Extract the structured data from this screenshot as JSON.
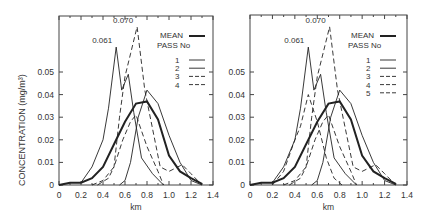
{
  "chart_data": [
    {
      "type": "line",
      "panel": "left",
      "title": "",
      "xlabel": "km",
      "ylabel": "CONCENTRATION (mg/m³)",
      "xlim": [
        0,
        1.4
      ],
      "ylim": [
        0,
        0.07
      ],
      "x_ticks": [
        "0",
        "0.2",
        "0.4",
        "0.6",
        "0.8",
        "1.0",
        "1.2",
        "1.4"
      ],
      "y_ticks": [
        "0",
        "0.01",
        "0.02",
        "0.03",
        "0.04",
        "0.05"
      ],
      "grid": false,
      "legend_position": "upper right",
      "legend_header": "PASS No",
      "annotations": [
        {
          "text": "0.061",
          "x": 0.52,
          "y": 0.061
        },
        {
          "text": "0.070",
          "x": 0.71,
          "y": 0.07
        }
      ],
      "series": [
        {
          "name": "MEAN",
          "style": "thick-solid",
          "x": [
            0,
            0.1,
            0.2,
            0.3,
            0.4,
            0.5,
            0.6,
            0.7,
            0.8,
            0.9,
            1.0,
            1.1,
            1.2,
            1.3
          ],
          "y": [
            0,
            0.001,
            0.001,
            0.003,
            0.008,
            0.018,
            0.028,
            0.036,
            0.037,
            0.029,
            0.013,
            0.006,
            0.003,
            0.0005
          ]
        },
        {
          "name": "1",
          "style": "solid",
          "x": [
            0.2,
            0.3,
            0.4,
            0.45,
            0.52,
            0.57,
            0.63,
            0.68,
            0.75,
            0.85,
            0.95
          ],
          "y": [
            0.001,
            0.008,
            0.02,
            0.034,
            0.061,
            0.042,
            0.049,
            0.032,
            0.012,
            0.005,
            0
          ],
          "peak_label": "0.061"
        },
        {
          "name": "2",
          "style": "solid",
          "x": [
            0.55,
            0.6,
            0.65,
            0.72,
            0.8,
            0.9,
            1.0,
            1.1,
            1.2,
            1.3
          ],
          "y": [
            0,
            0.002,
            0.01,
            0.03,
            0.042,
            0.036,
            0.022,
            0.01,
            0.002,
            0
          ]
        },
        {
          "name": "3",
          "style": "dashed",
          "x": [
            0.35,
            0.45,
            0.5,
            0.55,
            0.6,
            0.65,
            0.71,
            0.78,
            0.85,
            0.92,
            1.0,
            1.12,
            1.2,
            1.3
          ],
          "y": [
            0,
            0.003,
            0.008,
            0.03,
            0.048,
            0.058,
            0.07,
            0.042,
            0.025,
            0.008,
            0.006,
            0.009,
            0.005,
            0
          ]
        },
        {
          "name": "4",
          "style": "dashed",
          "x": [
            0.3,
            0.4,
            0.5,
            0.58,
            0.65,
            0.7,
            0.75,
            0.8,
            0.9,
            0.95
          ],
          "y": [
            0,
            0.002,
            0.008,
            0.02,
            0.028,
            0.031,
            0.024,
            0.017,
            0.006,
            0
          ]
        }
      ]
    },
    {
      "type": "line",
      "panel": "right",
      "title": "",
      "xlabel": "km",
      "ylabel": "",
      "xlim": [
        0,
        1.4
      ],
      "ylim": [
        0,
        0.07
      ],
      "x_ticks": [
        "0",
        "0.2",
        "0.4",
        "0.6",
        "0.8",
        "1.0",
        "1.2",
        "1.4"
      ],
      "y_ticks": [
        "0",
        "0.01",
        "0.02",
        "0.03",
        "0.04",
        "0.05"
      ],
      "grid": false,
      "legend_position": "upper right",
      "legend_header": "PASS No",
      "annotations": [
        {
          "text": "0.061",
          "x": 0.52,
          "y": 0.061
        },
        {
          "text": "0.070",
          "x": 0.71,
          "y": 0.07
        }
      ],
      "series": [
        {
          "name": "MEAN",
          "style": "thick-solid",
          "x": [
            0,
            0.1,
            0.2,
            0.3,
            0.4,
            0.5,
            0.6,
            0.7,
            0.8,
            0.9,
            1.0,
            1.1,
            1.2,
            1.3
          ],
          "y": [
            0,
            0.001,
            0.001,
            0.003,
            0.008,
            0.018,
            0.028,
            0.036,
            0.037,
            0.029,
            0.013,
            0.006,
            0.003,
            0.0005
          ]
        },
        {
          "name": "1",
          "style": "solid",
          "x": [
            0.2,
            0.3,
            0.4,
            0.45,
            0.52,
            0.57,
            0.63,
            0.68,
            0.75,
            0.85,
            0.95
          ],
          "y": [
            0.001,
            0.008,
            0.02,
            0.034,
            0.061,
            0.042,
            0.049,
            0.032,
            0.012,
            0.005,
            0
          ]
        },
        {
          "name": "2",
          "style": "solid",
          "x": [
            0.55,
            0.6,
            0.65,
            0.72,
            0.8,
            0.9,
            1.0,
            1.1,
            1.2,
            1.3
          ],
          "y": [
            0,
            0.002,
            0.01,
            0.03,
            0.042,
            0.036,
            0.022,
            0.01,
            0.002,
            0
          ]
        },
        {
          "name": "3",
          "style": "dashed",
          "x": [
            0.35,
            0.45,
            0.5,
            0.55,
            0.6,
            0.65,
            0.71,
            0.78,
            0.85,
            0.92,
            1.0,
            1.12,
            1.2,
            1.3
          ],
          "y": [
            0,
            0.003,
            0.008,
            0.03,
            0.048,
            0.058,
            0.07,
            0.042,
            0.025,
            0.008,
            0.006,
            0.009,
            0.005,
            0
          ]
        },
        {
          "name": "4",
          "style": "dashed",
          "x": [
            0.3,
            0.4,
            0.5,
            0.58,
            0.65,
            0.7,
            0.75,
            0.8,
            0.9,
            0.95
          ],
          "y": [
            0,
            0.002,
            0.008,
            0.02,
            0.028,
            0.031,
            0.024,
            0.017,
            0.006,
            0
          ]
        },
        {
          "name": "5",
          "style": "dashed",
          "x": [
            0.2,
            0.3,
            0.4,
            0.45,
            0.52,
            0.6,
            0.68,
            0.75,
            0.82
          ],
          "y": [
            0,
            0.006,
            0.02,
            0.026,
            0.04,
            0.028,
            0.012,
            0.003,
            0
          ]
        }
      ]
    }
  ],
  "labels": {
    "ylabel": "CONCENTRATION (mg/m³)",
    "xlabel": "km",
    "mean": "MEAN",
    "pass_no": "PASS No",
    "peak1": "0.061",
    "peak2": "0.070"
  }
}
